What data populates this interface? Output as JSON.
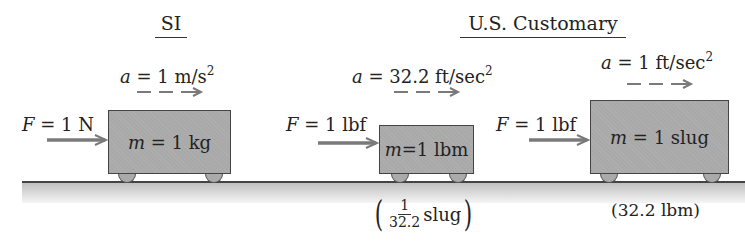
{
  "headings": {
    "si": "SI",
    "us": "U.S. Customary"
  },
  "si_case": {
    "accel_label": "a = 1 m/s",
    "accel_var": "a",
    "accel_value": "= 1 m/s",
    "accel_exp": "2",
    "force_var": "F",
    "force_value": "= 1 N",
    "mass_var": "m",
    "mass_value": "= 1 kg"
  },
  "us_lbm_case": {
    "accel_var": "a",
    "accel_value": "= 32.2 ft/sec",
    "accel_exp": "2",
    "force_var": "F",
    "force_value": "= 1 lbf",
    "mass_var": "m",
    "mass_value": "=1 lbm",
    "note_num": "1",
    "note_den": "32.2",
    "note_unit": "slug",
    "paren_open": "(",
    "paren_close": ")"
  },
  "us_slug_case": {
    "accel_var": "a",
    "accel_value": "= 1 ft/sec",
    "accel_exp": "2",
    "force_var": "F",
    "force_value": "= 1 lbf",
    "mass_var": "m",
    "mass_value": "= 1 slug",
    "note": "(32.2 lbm)"
  },
  "colors": {
    "arrow": "#7a7a7a",
    "block": "#a9a9a9",
    "ground": "#c0c0c0"
  }
}
